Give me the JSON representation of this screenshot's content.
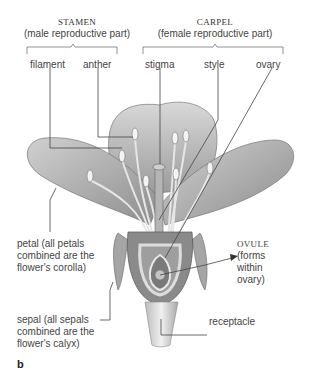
{
  "groups": {
    "stamen": {
      "title": "STAMEN",
      "subtitle": "(male reproductive part)"
    },
    "carpel": {
      "title": "CARPEL",
      "subtitle": "(female reproductive part)"
    }
  },
  "labels": {
    "filament": "filament",
    "anther": "anther",
    "stigma": "stigma",
    "style": "style",
    "ovary": "ovary",
    "petal": "petal (all petals\ncombined are the\nflower's corolla)",
    "sepal": "sepal (all sepals\ncombined are the\nflower's calyx)",
    "ovule_title": "OVULE",
    "ovule_note": "(forms\nwithin\novary)",
    "receptacle": "receptacle"
  },
  "figure_label": "b",
  "colors": {
    "leader_line": "#444444",
    "petal_fill": "#c9c9c9",
    "petal_dark": "#8a8a8a",
    "ovary_fill": "#7d7d7d"
  }
}
